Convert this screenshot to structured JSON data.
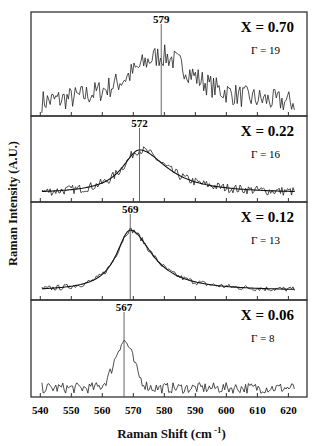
{
  "chart_data": {
    "type": "line",
    "title": "",
    "xlabel": "Raman Shift (cm -1)",
    "ylabel": "Raman Intensity (A.U.)",
    "xlim": [
      537,
      626
    ],
    "xticks": [
      540,
      550,
      560,
      570,
      580,
      590,
      600,
      610,
      620
    ],
    "grid": false,
    "legend": "none",
    "panels": [
      {
        "label": "X = 0.70",
        "gamma": "Γ = 19",
        "peak": 579,
        "width": 19,
        "fit": false,
        "noise": 0.14,
        "base": 0.18,
        "amp": 0.62,
        "shape": "broad"
      },
      {
        "label": "X = 0.22",
        "gamma": "Γ = 16",
        "peak": 572,
        "width": 16,
        "fit": true,
        "noise": 0.08,
        "base": 0.15,
        "amp": 0.68,
        "shape": "lorentz"
      },
      {
        "label": "X = 0.12",
        "gamma": "Γ = 13",
        "peak": 569,
        "width": 13,
        "fit": true,
        "noise": 0.04,
        "base": 0.08,
        "amp": 0.8,
        "shape": "lorentz"
      },
      {
        "label": "X = 0.06",
        "gamma": "Γ = 8",
        "peak": 567,
        "width": 8,
        "fit": false,
        "noise": 0.08,
        "base": 0.22,
        "amp": 0.62,
        "shape": "gauss"
      }
    ]
  },
  "labels": {
    "ylabel": "Raman Intensity (A.U.)",
    "xlabel_main": "Raman Shift (cm",
    "xlabel_sup": " -1",
    "xlabel_close": ")"
  }
}
